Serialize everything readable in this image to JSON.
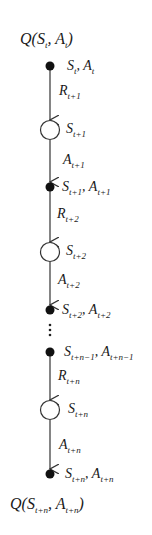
{
  "diagram": {
    "title_top": {
      "q": "Q(",
      "s": "S",
      "s_sub": "t",
      "sep": ", ",
      "a": "A",
      "a_sub": "t",
      "close": ")"
    },
    "title_bottom": {
      "q": "Q(",
      "s": "S",
      "s_sub": "t+n",
      "sep": ", ",
      "a": "A",
      "a_sub": "t+n",
      "close": ")"
    },
    "nodes": [
      {
        "type": "action",
        "s": "S",
        "s_sub": "t",
        "a": "A",
        "a_sub": "t"
      },
      {
        "type": "state",
        "s": "S",
        "s_sub": "t+1"
      },
      {
        "type": "action",
        "s": "S",
        "s_sub": "t+1",
        "a": "A",
        "a_sub": "t+1"
      },
      {
        "type": "state",
        "s": "S",
        "s_sub": "t+2"
      },
      {
        "type": "action",
        "s": "S",
        "s_sub": "t+2",
        "a": "A",
        "a_sub": "t+2"
      },
      {
        "type": "action",
        "s": "S",
        "s_sub": "t+n−1",
        "a": "A",
        "a_sub": "t+n−1"
      },
      {
        "type": "state",
        "s": "S",
        "s_sub": "t+n"
      },
      {
        "type": "action",
        "s": "S",
        "s_sub": "t+n",
        "a": "A",
        "a_sub": "t+n"
      }
    ],
    "edges": [
      {
        "sym": "R",
        "sub": "t+1"
      },
      {
        "sym": "A",
        "sub": "t+1"
      },
      {
        "sym": "R",
        "sub": "t+2"
      },
      {
        "sym": "A",
        "sub": "t+2"
      },
      {
        "sym": "R",
        "sub": "t+n"
      },
      {
        "sym": "A",
        "sub": "t+n"
      }
    ],
    "ellipsis": "⋮",
    "colors": {
      "line": "#333333",
      "fill": "#111111"
    }
  }
}
